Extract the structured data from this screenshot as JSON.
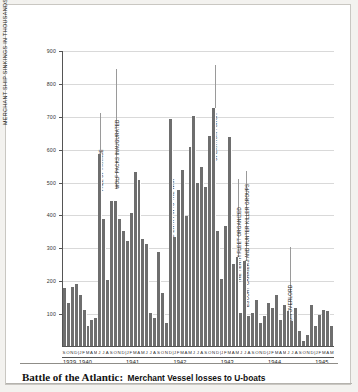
{
  "caption": {
    "main": "Battle of the Atlantic:",
    "sub": "Merchant Vessel losses to U-boats"
  },
  "axes": {
    "ytitle": "MERCHANT SHIP SINKINGS IN THOUSANDS OF TONS",
    "yticks": [
      100,
      200,
      300,
      400,
      500,
      600,
      700,
      800,
      900
    ],
    "years": [
      "1939",
      "1940",
      "1941",
      "1942",
      "1943",
      "1944",
      "1945"
    ]
  },
  "chart_data": {
    "type": "bar",
    "title": "Battle of the Atlantic: Merchant Vessel losses to U-boats",
    "xlabel": "",
    "ylabel": "MERCHANT SHIP SINKINGS IN THOUSANDS OF TONS",
    "ylim": [
      0,
      900
    ],
    "grid": true,
    "legend": "none",
    "bar_color": "#6e6e6e",
    "categories": [
      "S 1939",
      "O 1939",
      "N 1939",
      "D 1939",
      "J 1940",
      "F 1940",
      "M 1940",
      "A 1940",
      "M 1940",
      "J 1940",
      "J 1940",
      "A 1940",
      "S 1940",
      "O 1940",
      "N 1940",
      "D 1940",
      "J 1941",
      "F 1941",
      "M 1941",
      "A 1941",
      "M 1941",
      "J 1941",
      "J 1941",
      "A 1941",
      "S 1941",
      "O 1941",
      "N 1941",
      "D 1941",
      "J 1942",
      "F 1942",
      "M 1942",
      "A 1942",
      "M 1942",
      "J 1942",
      "J 1942",
      "A 1942",
      "S 1942",
      "O 1942",
      "N 1942",
      "D 1942",
      "J 1943",
      "F 1943",
      "M 1943",
      "A 1943",
      "M 1943",
      "J 1943",
      "J 1943",
      "A 1943",
      "S 1943",
      "O 1943",
      "N 1943",
      "D 1943",
      "J 1944",
      "F 1944",
      "M 1944",
      "A 1944",
      "M 1944",
      "J 1944",
      "J 1944",
      "A 1944",
      "S 1944",
      "O 1944",
      "N 1944",
      "D 1944",
      "J 1945",
      "F 1945",
      "M 1945",
      "A 1945",
      "M 1945"
    ],
    "month_labels": [
      "S",
      "O",
      "N",
      "D",
      "J",
      "F",
      "M",
      "A",
      "M",
      "J",
      "J",
      "A",
      "S",
      "O",
      "N",
      "D",
      "J",
      "F",
      "M",
      "A",
      "M",
      "J",
      "J",
      "A",
      "S",
      "O",
      "N",
      "D",
      "J",
      "F",
      "M",
      "A",
      "M",
      "J",
      "J",
      "A",
      "S",
      "O",
      "N",
      "D",
      "J",
      "F",
      "M",
      "A",
      "M",
      "J",
      "J",
      "A",
      "S",
      "O",
      "N",
      "D",
      "J",
      "F",
      "M",
      "A",
      "M",
      "J",
      "J",
      "A",
      "S",
      "O",
      "N",
      "D",
      "J",
      "F",
      "M",
      "A",
      "M"
    ],
    "values": [
      175,
      130,
      180,
      190,
      155,
      110,
      60,
      80,
      85,
      585,
      385,
      200,
      440,
      440,
      385,
      350,
      320,
      405,
      530,
      505,
      325,
      310,
      100,
      85,
      285,
      160,
      70,
      690,
      330,
      475,
      535,
      395,
      605,
      700,
      495,
      545,
      485,
      640,
      725,
      350,
      205,
      365,
      635,
      250,
      270,
      100,
      260,
      90,
      100,
      140,
      70,
      90,
      130,
      115,
      155,
      80,
      125,
      105,
      75,
      115,
      45,
      15,
      35,
      125,
      60,
      95,
      110,
      105,
      60
    ],
    "annotations": [
      {
        "text": "FALL OF FRANCE",
        "at": "JUN 1940"
      },
      {
        "text": "WOLF PACKS INAUGURATED",
        "at": "OCT 1940"
      },
      {
        "text": "US ENTRY INTO THE WAR",
        "at": "DEC 1941"
      },
      {
        "text": "OPERATION TORCH",
        "at": "NOV 1942"
      },
      {
        "text": "THE TENTH FLEET ORGANIZED",
        "at": "MAY 1943"
      },
      {
        "text": "ESCORT CARRIERS AND HUNTER KILLER GROUPS",
        "at": "JUL 1943"
      },
      {
        "text": "OPERATION OVERLORD",
        "at": "JUN 1944"
      }
    ]
  }
}
